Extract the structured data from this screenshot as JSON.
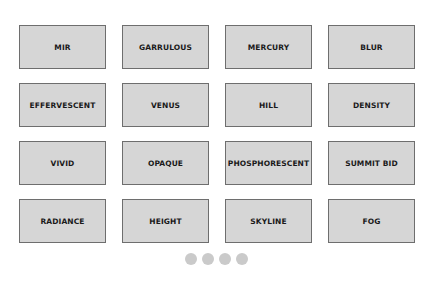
{
  "grid": {
    "tiles": [
      {
        "label": "MIR"
      },
      {
        "label": "GARRULOUS"
      },
      {
        "label": "MERCURY"
      },
      {
        "label": "BLUR"
      },
      {
        "label": "EFFERVESCENT"
      },
      {
        "label": "VENUS"
      },
      {
        "label": "HILL"
      },
      {
        "label": "DENSITY"
      },
      {
        "label": "VIVID"
      },
      {
        "label": "OPAQUE"
      },
      {
        "label": "PHOSPHORESCENT"
      },
      {
        "label": "SUMMIT BID"
      },
      {
        "label": "RADIANCE"
      },
      {
        "label": "HEIGHT"
      },
      {
        "label": "SKYLINE"
      },
      {
        "label": "FOG"
      }
    ]
  },
  "pager": {
    "page_count": 4
  },
  "colors": {
    "tile_fill": "#d6d6d6",
    "tile_border": "#6e6e6e",
    "dot": "#cacaca"
  }
}
